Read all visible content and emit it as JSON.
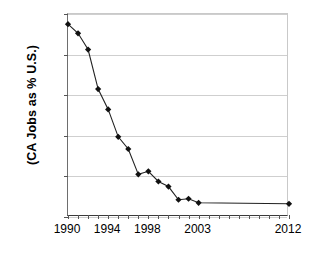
{
  "chart_data": {
    "type": "line",
    "title": "",
    "xlabel": "",
    "ylabel": "(CA Jobs as % U.S.)",
    "xlim": [
      1990,
      2012
    ],
    "ylim": [
      16,
      26
    ],
    "yticks": [
      "16%",
      "18%",
      "20%",
      "22%",
      "24%",
      "26%"
    ],
    "ytick_values": [
      16,
      18,
      20,
      22,
      24,
      26
    ],
    "xticks": [
      "1990",
      "1994",
      "1998",
      "2003",
      "2012"
    ],
    "xtick_values": [
      1990,
      1994,
      1998,
      2003,
      2012
    ],
    "grid": "horizontal",
    "legend": "none",
    "marker": "filled-diamond",
    "marker_color": "#111111",
    "line_color": "#222222",
    "x": [
      1990,
      1991,
      1992,
      1993,
      1994,
      1995,
      1996,
      1997,
      1998,
      1999,
      2000,
      2001,
      2002,
      2003,
      2012
    ],
    "values": [
      25.5,
      25.05,
      24.25,
      22.3,
      21.3,
      19.95,
      19.35,
      18.1,
      18.25,
      17.75,
      17.5,
      16.85,
      16.9,
      16.7,
      16.65
    ],
    "series": [
      {
        "name": "CA Jobs as % U.S.",
        "values": [
          25.5,
          25.05,
          24.25,
          22.3,
          21.3,
          19.95,
          19.35,
          18.1,
          18.25,
          17.75,
          17.5,
          16.85,
          16.9,
          16.7,
          16.65
        ]
      }
    ]
  }
}
